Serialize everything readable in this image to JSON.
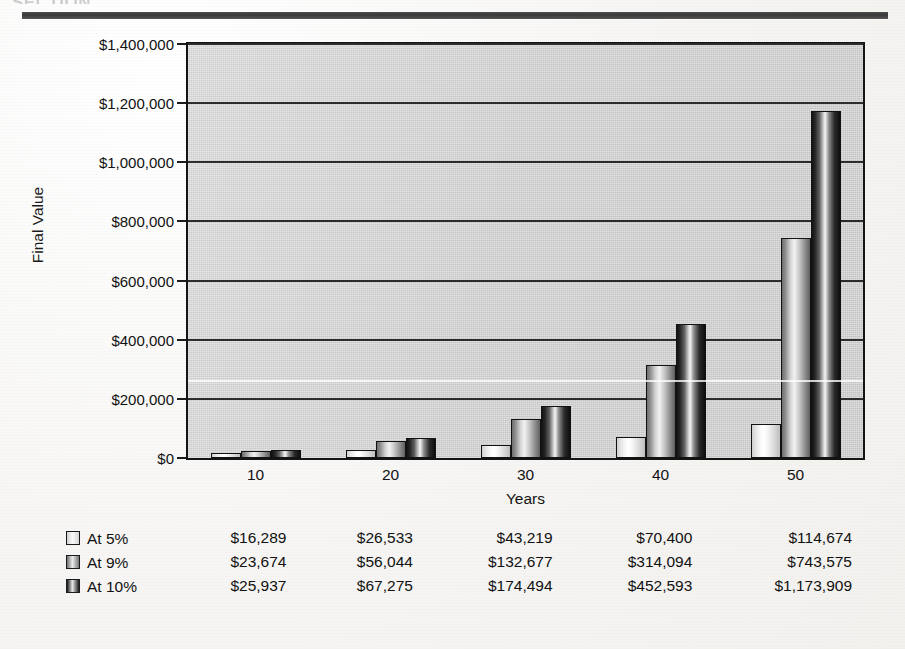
{
  "page": {
    "header_ghost_text": "SECTION"
  },
  "chart_data": {
    "type": "bar",
    "title": "",
    "xlabel": "Years",
    "ylabel": "Final Value",
    "categories": [
      "10",
      "20",
      "30",
      "40",
      "50"
    ],
    "ylim": [
      0,
      1400000
    ],
    "ytick_step": 200000,
    "ytick_labels": [
      "$0",
      "$200,000",
      "$400,000",
      "$600,000",
      "$800,000",
      "$1,000,000",
      "$1,200,000",
      "$1,400,000"
    ],
    "ytick_values": [
      0,
      200000,
      400000,
      600000,
      800000,
      1000000,
      1200000,
      1400000
    ],
    "grid": true,
    "legend_position": "bottom-table",
    "series": [
      {
        "name": "At 5%",
        "values": [
          16289,
          26533,
          43219,
          70400,
          114674
        ],
        "value_labels": [
          "$16,289",
          "$26,533",
          "$43,219",
          "$70,400",
          "$114,674"
        ],
        "color": "#e8e8e8"
      },
      {
        "name": "At 9%",
        "values": [
          23674,
          56044,
          132677,
          314094,
          743575
        ],
        "value_labels": [
          "$23,674",
          "$56,044",
          "$132,677",
          "$314,094",
          "$743,575"
        ],
        "color": "#909090"
      },
      {
        "name": "At 10%",
        "values": [
          25937,
          67275,
          174494,
          452593,
          1173909
        ],
        "value_labels": [
          "$25,937",
          "$67,275",
          "$174,494",
          "$452,593",
          "$1,173,909"
        ],
        "color": "#1a1a1a"
      }
    ]
  }
}
